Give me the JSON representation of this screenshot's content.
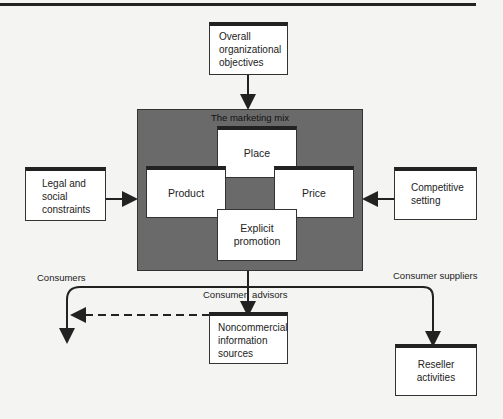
{
  "diagram": {
    "top_box": "Overall organizational objectives",
    "top_box_lines": [
      "Overall",
      "organizational",
      "objectives"
    ],
    "mix_title": "The marketing mix",
    "mix_elements": {
      "place": "Place",
      "product": "Product",
      "price": "Price",
      "promotion_lines": [
        "Explicit",
        "promotion"
      ]
    },
    "left_box_lines": [
      "Legal and",
      "social",
      "constraints"
    ],
    "right_box_lines": [
      "Competitive",
      "setting"
    ],
    "labels": {
      "consumers": "Consumers",
      "consumer_advisors": "Consumer  advisors",
      "consumer_suppliers": "Consumer suppliers"
    },
    "noncommercial_lines": [
      "Noncommercial",
      "information",
      "sources"
    ],
    "reseller_lines": [
      "Reseller",
      "activities"
    ]
  }
}
